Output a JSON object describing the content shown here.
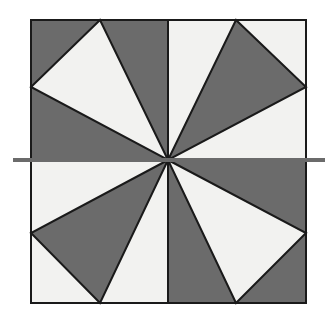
{
  "figure": {
    "canvas": {
      "width": 336,
      "height": 322,
      "background": "#ffffff"
    },
    "colors": {
      "dark_fill": "#6b6b6b",
      "light_fill": "#f2f2f0",
      "outline": "#1a1a1a",
      "axis_line": "#6b6b6b",
      "background": "#ffffff"
    },
    "square": {
      "left": 31,
      "top": 20,
      "right": 306,
      "bottom": 303,
      "width": 275,
      "height": 283,
      "stroke_width": 2
    },
    "center_point": {
      "x": 168,
      "y": 160
    },
    "vertical_divider": {
      "x": 168,
      "y1": 20,
      "y2": 303
    },
    "axis_line": {
      "label": "horizontal-axis-line",
      "x1": 13,
      "x2": 325,
      "y": 160,
      "thickness": 4
    },
    "quadrants": [
      {
        "name": "top-left",
        "background_fill": "dark",
        "triangle_fill": "light",
        "triangle_points": "168,160 100,20 31,87"
      },
      {
        "name": "top-right",
        "background_fill": "light",
        "triangle_fill": "dark",
        "triangle_points": "168,160 236,20 306,87"
      },
      {
        "name": "bottom-left",
        "background_fill": "light",
        "triangle_fill": "dark",
        "triangle_points": "168,160 31,233 100,303"
      },
      {
        "name": "bottom-right",
        "background_fill": "dark",
        "triangle_fill": "light",
        "triangle_points": "168,160 306,233 236,303"
      }
    ]
  }
}
